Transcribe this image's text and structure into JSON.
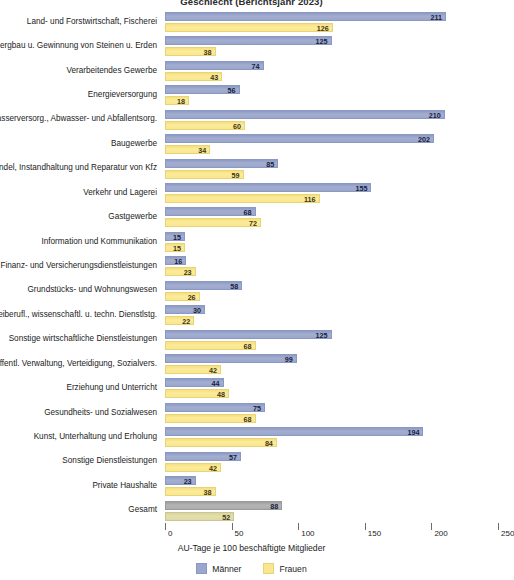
{
  "chart_data": {
    "type": "bar",
    "orientation": "horizontal",
    "title": "Geschlecht (Berichtsjahr 2023)",
    "xlabel": "AU-Tage je 100 beschäftigte Mitglieder",
    "ylabel": "",
    "xlim": [
      0,
      250
    ],
    "xticks": [
      0,
      50,
      100,
      150,
      200,
      250
    ],
    "xtick_labels": [
      "0",
      "50",
      "100",
      "150",
      "200",
      "250"
    ],
    "grid": false,
    "legend_position": "bottom",
    "categories": [
      "Land- und Forstwirtschaft, Fischerei",
      "Bergbau u. Gewinnung von Steinen u. Erden",
      "Verarbeitendes Gewerbe",
      "Energieversorgung",
      "Wasserversorg., Abwasser- und Abfallentsorg.",
      "Baugewerbe",
      "Handel, Instandhaltung und Reparatur von Kfz",
      "Verkehr und Lagerei",
      "Gastgewerbe",
      "Information und Kommunikation",
      "Finanz- und Versicherungsdienstleistungen",
      "Grundstücks- und Wohnungswesen",
      "Freiberufl., wissenschaftl. u. techn. Dienstlstg.",
      "Sonstige wirtschaftliche Dienstleistungen",
      "Öffentl. Verwaltung, Verteidigung, Sozialvers.",
      "Erziehung und Unterricht",
      "Gesundheits- und Sozialwesen",
      "Kunst, Unterhaltung und Erholung",
      "Sonstige Dienstleistungen",
      "Private Haushalte",
      "Gesamt"
    ],
    "series": [
      {
        "name": "Männer",
        "color": "#9aa6cc",
        "values": [
          211,
          125,
          74,
          56,
          210,
          202,
          85,
          155,
          68,
          15,
          16,
          58,
          30,
          125,
          99,
          44,
          75,
          194,
          57,
          23,
          88
        ]
      },
      {
        "name": "Frauen",
        "color": "#f9e68f",
        "values": [
          126,
          38,
          43,
          18,
          60,
          34,
          59,
          116,
          72,
          15,
          23,
          26,
          22,
          68,
          42,
          48,
          68,
          84,
          42,
          38,
          52
        ]
      }
    ]
  },
  "legend": {
    "items": [
      {
        "label": "Männer",
        "color": "#9aa6cc"
      },
      {
        "label": "Frauen",
        "color": "#f9e68f"
      }
    ]
  }
}
